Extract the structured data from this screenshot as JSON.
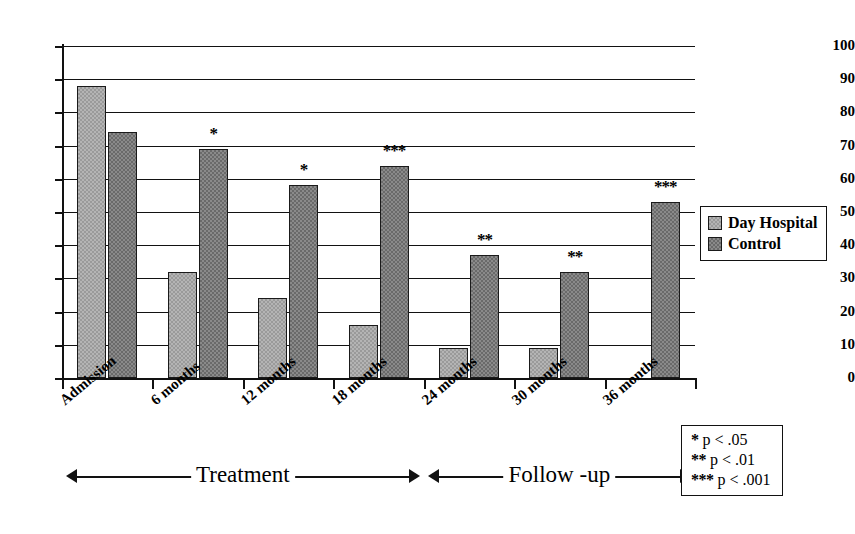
{
  "chart_data": {
    "type": "bar",
    "title": "",
    "subtitle": "",
    "xlabel": "",
    "ylabel": "",
    "ylim": [
      0,
      100
    ],
    "ytick_step": 10,
    "grid": true,
    "legend_position": "right",
    "categories": [
      "Admission",
      "6 months",
      "12 months",
      "18 months",
      "24 months",
      "30 months",
      "36 months"
    ],
    "yticks": [
      "0",
      "10",
      "20",
      "30",
      "40",
      "50",
      "60",
      "70",
      "80",
      "90",
      "100"
    ],
    "series": [
      {
        "name": "Day Hospital",
        "values": [
          88,
          32,
          24,
          16,
          9,
          9,
          0
        ],
        "color": "#b4b4b4"
      },
      {
        "name": "Control",
        "values": [
          74,
          69,
          58,
          64,
          37,
          32,
          53
        ],
        "color": "#8a8a8a"
      }
    ],
    "annotations": [
      {
        "category": "Admission",
        "marker": ""
      },
      {
        "category": "6 months",
        "marker": "*"
      },
      {
        "category": "12 months",
        "marker": "*"
      },
      {
        "category": "18 months",
        "marker": "***"
      },
      {
        "category": "24 months",
        "marker": "**"
      },
      {
        "category": "30 months",
        "marker": "**"
      },
      {
        "category": "36 months",
        "marker": "***"
      }
    ],
    "phases": [
      {
        "label": "Treatment",
        "from": "Admission",
        "to": "18 months"
      },
      {
        "label": "Follow -up",
        "from": "24 months",
        "to": "36 months"
      }
    ],
    "significance_note": [
      {
        "stars": "*",
        "text": "p < .05"
      },
      {
        "stars": "**",
        "text": "p < .01"
      },
      {
        "stars": "***",
        "text": "p < .001"
      }
    ]
  }
}
